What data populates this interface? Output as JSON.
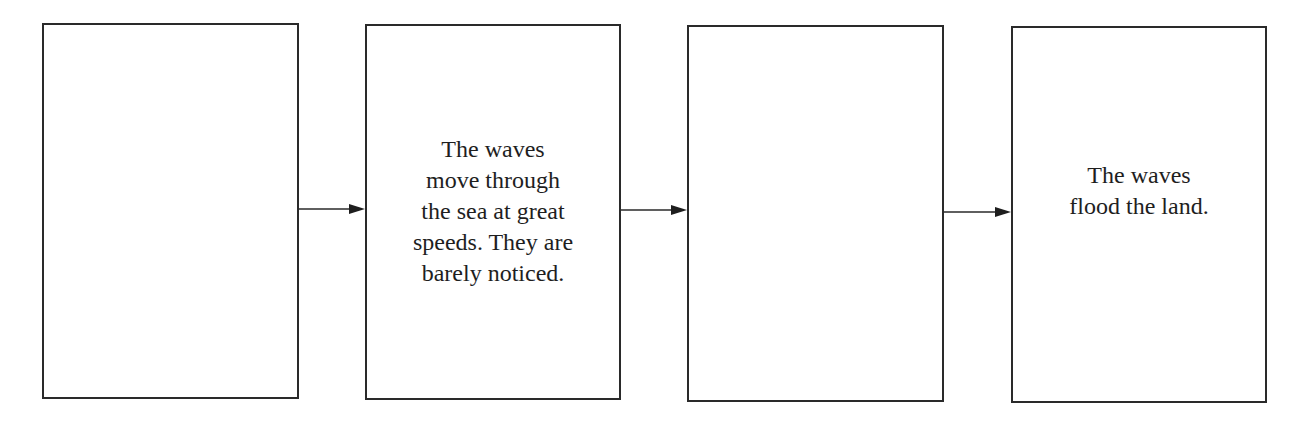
{
  "diagram": {
    "type": "flow-sequence",
    "direction": "left-to-right",
    "boxes": [
      {
        "text": ""
      },
      {
        "text": "The waves\nmove through\nthe sea at great\nspeeds. They are\nbarely noticed."
      },
      {
        "text": ""
      },
      {
        "text": "The waves\nflood the land."
      }
    ],
    "arrows": [
      {
        "from": 0,
        "to": 1
      },
      {
        "from": 1,
        "to": 2
      },
      {
        "from": 2,
        "to": 3
      }
    ],
    "colors": {
      "stroke": "#2a2a2a",
      "text": "#1e1e1e",
      "background": "#ffffff"
    }
  }
}
